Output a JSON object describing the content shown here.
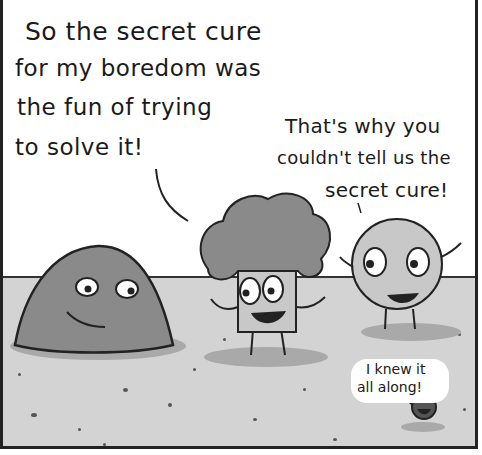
{
  "comic": {
    "speech": [
      {
        "speaker": "blob",
        "lines": [
          "So the secret cure",
          "for my boredom was",
          "the fun of trying",
          "to solve it!"
        ]
      },
      {
        "speaker": "round-character",
        "lines": [
          "That's why you",
          "couldn't tell us the",
          "secret cure!"
        ]
      },
      {
        "speaker": "small-pebble",
        "lines": [
          "I knew it",
          "all along!"
        ]
      }
    ],
    "characters": [
      "grey-blob",
      "broccoli-haired-square",
      "round-ball",
      "small-pebble"
    ],
    "colors": {
      "background": "#ffffff",
      "ground": "#d3d3d3",
      "ink": "#1a1a1a",
      "character_fill": "#8a8a8a",
      "shadow": "#a9a9a9"
    }
  }
}
